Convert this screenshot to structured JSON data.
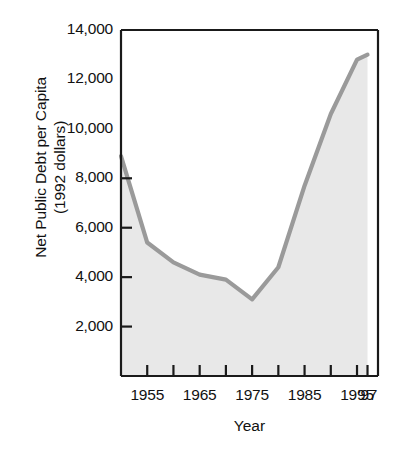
{
  "chart_data": {
    "type": "area",
    "title": "",
    "xlabel": "Year",
    "ylabel_line1": "Net Public Debt per Capita",
    "ylabel_line2": "(1992 dollars)",
    "ylim": [
      0,
      14000
    ],
    "ytick_values": [
      2000,
      4000,
      6000,
      8000,
      10000,
      12000,
      14000
    ],
    "ytick_labels": [
      "2,000",
      "4,000",
      "6,000",
      "8,000",
      "10,000",
      "12,000",
      "14,000"
    ],
    "yticks_with_marks": [
      2000,
      4000,
      6000,
      8000
    ],
    "xlim": [
      1950,
      1999
    ],
    "xtick_values": [
      1955,
      1960,
      1965,
      1970,
      1975,
      1980,
      1985,
      1990,
      1995,
      1997
    ],
    "xtick_labels": [
      "1955",
      "1965",
      "1975",
      "1985",
      "1995",
      "'97"
    ],
    "xtick_labeled_values": [
      1955,
      1965,
      1975,
      1985,
      1995,
      1997
    ],
    "grid": false,
    "legend": "none",
    "series": [
      {
        "name": "Net public debt per capita (1992 dollars)",
        "x": [
          1950,
          1955,
          1960,
          1965,
          1970,
          1975,
          1980,
          1985,
          1990,
          1995,
          1997
        ],
        "values": [
          8900,
          5400,
          4600,
          4100,
          3900,
          3100,
          4400,
          7700,
          10600,
          12800,
          13000
        ]
      }
    ],
    "line_color": "#9a9a9a",
    "fill_color": "#e8e8e8",
    "axis_color": "#1a1a1a"
  },
  "plot_geometry": {
    "left": 121,
    "right": 378,
    "top": 30,
    "bottom": 376
  }
}
